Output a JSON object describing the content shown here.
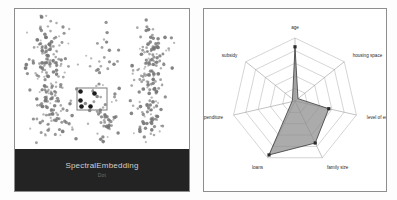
{
  "left_panel": {
    "name": "scatter-embedding-panel",
    "footer_title": "SpectralEmbedding",
    "footer_subtitle": "Dot",
    "selection_box": {
      "x": 62,
      "y": 79,
      "w": 30,
      "h": 22
    },
    "selected_point_count": 5,
    "colors": {
      "footer_bg": "#232323",
      "footer_text": "#cfcfcf",
      "point": "#767676",
      "selected_point": "#1c1c1c",
      "border": "#8e8e8e"
    }
  },
  "right_panel": {
    "name": "radar-chart-panel",
    "colors": {
      "fill": "#8a8a8a",
      "stroke": "#4a4a4a",
      "grid": "#b9b9b9",
      "border": "#8e8e8e"
    }
  },
  "chart_data": {
    "type": "radar",
    "title": "",
    "categories": [
      "age",
      "housing space",
      "level of education",
      "family size",
      "loans",
      "medical expenditure",
      "subsidy"
    ],
    "values": [
      0.86,
      0.06,
      0.55,
      0.74,
      0.95,
      0.05,
      0.05
    ],
    "rings": [
      0.2,
      0.4,
      0.6,
      0.8,
      1.0
    ],
    "rlim": [
      0,
      1
    ],
    "grid": true,
    "legend": "none",
    "series": [
      {
        "name": "selected cluster",
        "values": [
          0.86,
          0.06,
          0.55,
          0.74,
          0.95,
          0.05,
          0.05
        ]
      }
    ]
  },
  "scatter_data": {
    "type": "scatter",
    "title": "SpectralEmbedding",
    "xlabel": "",
    "ylabel": "",
    "clusters": [
      {
        "name": "left-cluster",
        "cx": 36,
        "cy": 68,
        "n": 120
      },
      {
        "name": "center-cluster",
        "cx": 88,
        "cy": 70,
        "n": 55
      },
      {
        "name": "right-cluster",
        "cx": 136,
        "cy": 66,
        "n": 95
      }
    ]
  }
}
